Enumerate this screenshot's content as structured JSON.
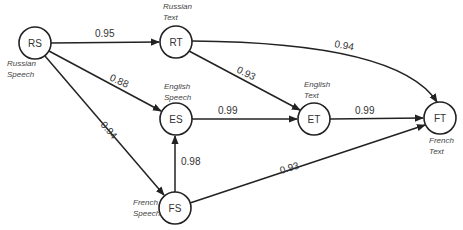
{
  "diagram": {
    "nodes": [
      {
        "id": "RS",
        "label": "RS",
        "caption_line1": "Russian",
        "caption_line2": "Speech"
      },
      {
        "id": "RT",
        "label": "RT",
        "caption_line1": "Russian",
        "caption_line2": "Text"
      },
      {
        "id": "ES",
        "label": "ES",
        "caption_line1": "English",
        "caption_line2": "Speech"
      },
      {
        "id": "ET",
        "label": "ET",
        "caption_line1": "English",
        "caption_line2": "Text"
      },
      {
        "id": "FT",
        "label": "FT",
        "caption_line1": "French",
        "caption_line2": "Text"
      },
      {
        "id": "FS",
        "label": "FS",
        "caption_line1": "French",
        "caption_line2": "Speech"
      }
    ],
    "edges": [
      {
        "from": "RS",
        "to": "RT",
        "weight": "0.95"
      },
      {
        "from": "RS",
        "to": "ES",
        "weight": "0.88"
      },
      {
        "from": "RS",
        "to": "FS",
        "weight": "0.94"
      },
      {
        "from": "RT",
        "to": "ET",
        "weight": "0.93"
      },
      {
        "from": "RT",
        "to": "FT",
        "weight": "0.94"
      },
      {
        "from": "ES",
        "to": "ET",
        "weight": "0.99"
      },
      {
        "from": "ET",
        "to": "FT",
        "weight": "0.99"
      },
      {
        "from": "FS",
        "to": "ES",
        "weight": "0.98"
      },
      {
        "from": "FS",
        "to": "FT",
        "weight": "0.93"
      }
    ]
  }
}
